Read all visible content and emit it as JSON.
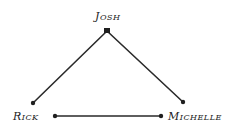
{
  "diagram": {
    "type": "graph",
    "colors": {
      "edge": "#2a2a2a",
      "node": "#1f1f1f",
      "text": "#222222",
      "background": "#ffffff"
    },
    "nodes": [
      {
        "id": "josh",
        "label": "Josh"
      },
      {
        "id": "rick",
        "label": "Rick"
      },
      {
        "id": "michelle",
        "label": "Michelle"
      }
    ],
    "edges": [
      {
        "from": "josh",
        "to": "rick"
      },
      {
        "from": "josh",
        "to": "michelle"
      },
      {
        "from": "rick",
        "to": "michelle"
      }
    ]
  }
}
